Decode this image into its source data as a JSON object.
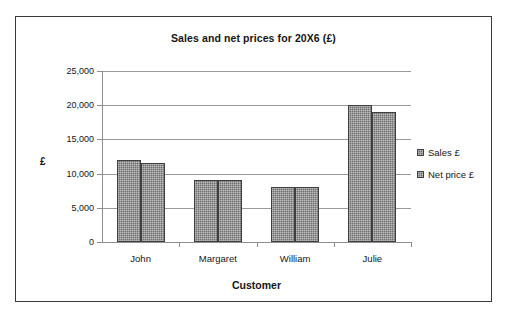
{
  "chart_data": {
    "type": "bar",
    "title": "Sales and net prices for 20X6 (£)",
    "xlabel": "Customer",
    "ylabel": "£",
    "categories": [
      "John",
      "Margaret",
      "William",
      "Julie"
    ],
    "series": [
      {
        "name": "Sales £",
        "values": [
          12000,
          9000,
          8000,
          20000
        ]
      },
      {
        "name": "Net price £",
        "values": [
          11500,
          9000,
          8000,
          19000
        ]
      }
    ],
    "ylim": [
      0,
      25000
    ],
    "ytick_values": [
      0,
      5000,
      10000,
      15000,
      20000,
      25000
    ],
    "ytick_labels": [
      "0",
      "5,000",
      "10,000",
      "15,000",
      "20,000",
      "25,000"
    ],
    "grid": true,
    "legend_position": "right",
    "colors": {
      "bar_fill": "#6f6f6f",
      "bar_border": "#3f3f3f",
      "gridline": "#9a9a9a",
      "axis": "#8e8e8e",
      "text": "#151515",
      "frame_border": "#3a3a3a",
      "background": "#ffffff"
    }
  },
  "legend": {
    "items": [
      {
        "label": "Sales £",
        "marker": "square-marker"
      },
      {
        "label": "Net price £",
        "marker": "square-marker"
      }
    ]
  }
}
